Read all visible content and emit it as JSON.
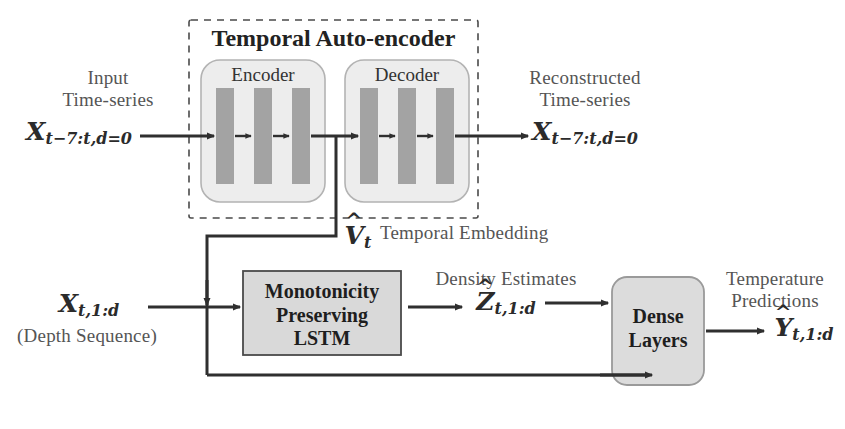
{
  "diagram": {
    "title": "Temporal Auto-encoder",
    "autoencoder": {
      "encoder_label": "Encoder",
      "decoder_label": "Decoder",
      "layer_count": 3
    },
    "inputs": {
      "timeseries_caption_line1": "Input",
      "timeseries_caption_line2": "Time-series",
      "timeseries_symbol_base": "X",
      "timeseries_symbol_sub": "t−7:t,d=0",
      "depth_symbol_base": "X",
      "depth_symbol_sub": "t,1:d",
      "depth_caption": "(Depth Sequence)"
    },
    "outputs": {
      "reconstructed_caption_line1": "Reconstructed",
      "reconstructed_caption_line2": "Time-series",
      "reconstructed_symbol_base": "X",
      "reconstructed_symbol_sub": "t−7:t,d=0",
      "prediction_caption_line1": "Temperature",
      "prediction_caption_line2": "Predictions",
      "prediction_symbol_hat": "^",
      "prediction_symbol_base": "Y",
      "prediction_symbol_sub": "t,1:d"
    },
    "embedding": {
      "symbol_hat": "^",
      "symbol_base": "V",
      "symbol_sub": "t",
      "caption": "Temporal Embedding"
    },
    "lstm": {
      "line1": "Monotonicity",
      "line2": "Preserving",
      "line3": "LSTM"
    },
    "density": {
      "caption": "Density Estimates",
      "symbol_hat": "^",
      "symbol_base": "Z",
      "symbol_sub": "t,1:d"
    },
    "dense": {
      "line1": "Dense",
      "line2": "Layers"
    },
    "colors": {
      "bar_fill": "#a3a3a3",
      "box_fill": "#ededed",
      "block_fill": "#d9d9d9",
      "stroke": "#8c8c8c",
      "arrow": "#2f2f2f",
      "text": "#555555"
    }
  }
}
